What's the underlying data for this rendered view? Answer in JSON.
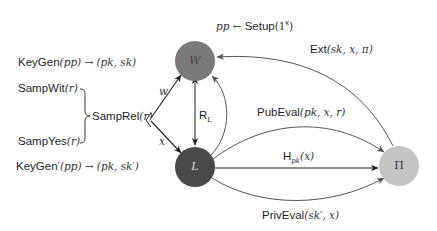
{
  "setup": {
    "lhs": "pp",
    "arrow": "←",
    "fn": "Setup",
    "arg": "(1",
    "sup": "κ",
    "close": ")"
  },
  "left": {
    "keygen": {
      "fn": "KeyGen",
      "arg": "(pp)",
      "arrow": "→",
      "out": "(pk, sk)"
    },
    "sampwit": {
      "fn": "SampWit",
      "arg": "(r)"
    },
    "sampyes": {
      "fn": "SampYes",
      "arg": "(r)"
    },
    "samprel": {
      "fn": "SampRel",
      "arg": "(r)"
    },
    "keygen_prime": {
      "fn": "KeyGen",
      "prime": "′",
      "arg": "(pp)",
      "arrow": "→",
      "out": "(pk, sk′)"
    }
  },
  "nodes": {
    "W": {
      "label": "W",
      "color": "#7a7a7a"
    },
    "L": {
      "label": "L",
      "color": "#4a4a4a"
    },
    "Pi": {
      "label": "Π",
      "color": "#c4c4c4"
    }
  },
  "edges": {
    "w": {
      "label": "w"
    },
    "x": {
      "label": "x"
    },
    "RL": {
      "label": "R",
      "sub": "L"
    },
    "ext": {
      "fn": "Ext",
      "arg": "(sk, x, π)"
    },
    "pubeval": {
      "fn": "PubEval",
      "arg": "(pk, x, r)"
    },
    "hpk": {
      "fn": "H",
      "sub": "pk",
      "arg": "(x)"
    },
    "priveval": {
      "fn": "PrivEval",
      "arg": "(sk′, x)"
    }
  },
  "colors": {
    "edge": "#555555",
    "edge_dark": "#222222"
  }
}
